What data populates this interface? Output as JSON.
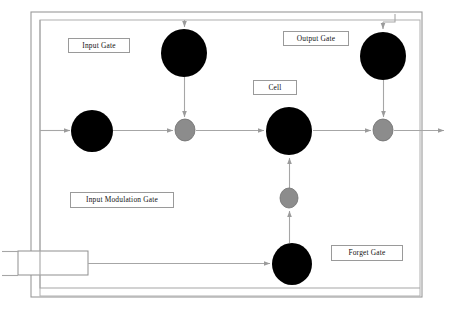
{
  "diagram": {
    "type": "neural-network-unit-diagram",
    "colors": {
      "node_dark": "#000000",
      "node_gray": "#8c8c8c",
      "node_gray_stroke": "#6e6e6e",
      "connector": "#a6a6a6",
      "border": "#9a9a9a",
      "background": "#ffffff",
      "label_text": "#111111"
    },
    "labels": [
      {
        "id": "input-gate",
        "text": "Input Gate"
      },
      {
        "id": "output-gate",
        "text": "Output Gate"
      },
      {
        "id": "cell",
        "text": "Cell"
      },
      {
        "id": "input-modulation-gate",
        "text": "Input Modulation Gate"
      },
      {
        "id": "forget-gate",
        "text": "Forget Gate"
      }
    ],
    "nodes": [
      {
        "id": "input-node",
        "shape": "circle",
        "fill": "node_dark",
        "cx": 92,
        "cy": 131,
        "rx": 21,
        "ry": 21
      },
      {
        "id": "input-gate-node",
        "shape": "circle",
        "fill": "node_dark",
        "cx": 184,
        "cy": 53,
        "rx": 23,
        "ry": 24
      },
      {
        "id": "input-multiply-node",
        "shape": "circle",
        "fill": "node_gray",
        "cx": 185,
        "cy": 130,
        "rx": 10,
        "ry": 11
      },
      {
        "id": "cell-node",
        "shape": "circle",
        "fill": "node_dark",
        "cx": 289,
        "cy": 131,
        "rx": 23,
        "ry": 24
      },
      {
        "id": "output-gate-node",
        "shape": "circle",
        "fill": "node_dark",
        "cx": 383,
        "cy": 56,
        "rx": 23,
        "ry": 24
      },
      {
        "id": "output-multiply-node",
        "shape": "circle",
        "fill": "node_gray",
        "cx": 383,
        "cy": 130,
        "rx": 10,
        "ry": 11
      },
      {
        "id": "forget-multiply-node",
        "shape": "circle",
        "fill": "node_gray",
        "cx": 289,
        "cy": 198,
        "rx": 9,
        "ry": 10
      },
      {
        "id": "forget-gate-node",
        "shape": "circle",
        "fill": "node_dark",
        "cx": 292,
        "cy": 264,
        "rx": 20,
        "ry": 21
      }
    ],
    "boxes": [
      {
        "id": "outer-border",
        "x": 31,
        "y": 12,
        "w": 391,
        "h": 285
      },
      {
        "id": "inner-border",
        "x": 40,
        "y": 20,
        "w": 380,
        "h": 276
      },
      {
        "id": "input-stub-box",
        "x": 18,
        "y": 251,
        "w": 70,
        "h": 24
      }
    ],
    "connections": [
      {
        "id": "input-to-gate",
        "from": "input-node",
        "to": "input-multiply-node"
      },
      {
        "id": "inputgate-to-multiply",
        "from": "input-gate-node",
        "to": "input-multiply-node"
      },
      {
        "id": "multiply-to-cell",
        "from": "input-multiply-node",
        "to": "cell-node"
      },
      {
        "id": "cell-to-output-multiply",
        "from": "cell-node",
        "to": "output-multiply-node"
      },
      {
        "id": "outputgate-to-multiply",
        "from": "output-gate-node",
        "to": "output-multiply-node"
      },
      {
        "id": "multiply-to-output",
        "from": "output-multiply-node",
        "to": "hidden-state-output"
      },
      {
        "id": "forget-to-multiply",
        "from": "forget-gate-node",
        "to": "forget-multiply-node"
      },
      {
        "id": "forget-multiply-to-cell",
        "from": "forget-multiply-node",
        "to": "cell-node"
      },
      {
        "id": "recurrent-to-inputgate",
        "from": "inner-border",
        "to": "input-gate-node"
      },
      {
        "id": "recurrent-to-outputgate",
        "from": "inner-border",
        "to": "output-gate-node"
      },
      {
        "id": "input-stub-to-forget",
        "from": "input-stub-box",
        "to": "forget-gate-node"
      }
    ]
  }
}
